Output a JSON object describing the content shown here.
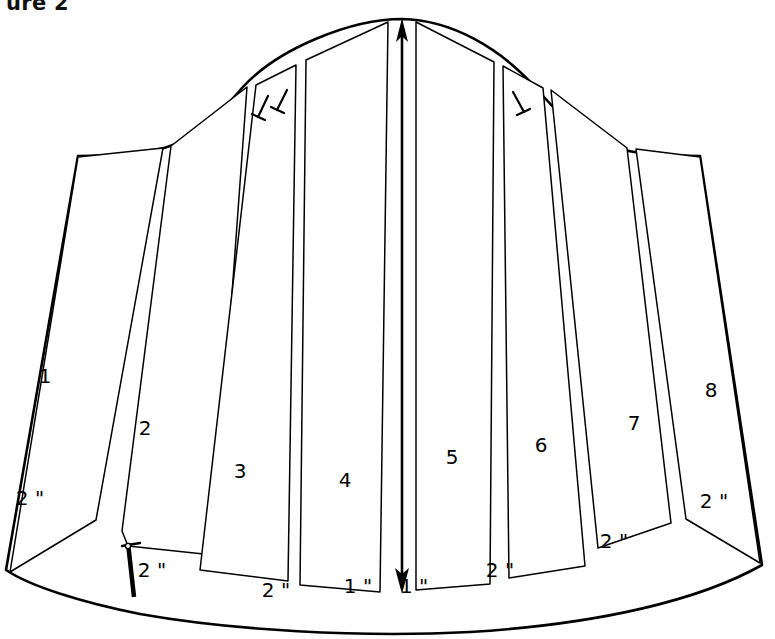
{
  "figure": {
    "caption": "ure 2",
    "title_visible_fragment": "ure 2"
  },
  "diagram": {
    "type": "sewing-pattern-slash-and-spread",
    "line_color": "#000000",
    "fill_color": "#ffffff",
    "background": "#ffffff"
  },
  "sections": [
    {
      "id": 1,
      "label": "1",
      "x": 45,
      "y": 383
    },
    {
      "id": 2,
      "label": "2",
      "x": 145,
      "y": 435
    },
    {
      "id": 3,
      "label": "3",
      "x": 240,
      "y": 478
    },
    {
      "id": 4,
      "label": "4",
      "x": 345,
      "y": 487
    },
    {
      "id": 5,
      "label": "5",
      "x": 452,
      "y": 464
    },
    {
      "id": 6,
      "label": "6",
      "x": 541,
      "y": 452
    },
    {
      "id": 7,
      "label": "7",
      "x": 634,
      "y": 430
    },
    {
      "id": 8,
      "label": "8",
      "x": 711,
      "y": 397
    }
  ],
  "measurements": [
    {
      "id": "gap-left-1",
      "label": "2 \"",
      "x": 30,
      "y": 505
    },
    {
      "id": "gap-left-2",
      "label": "2 \"",
      "x": 143,
      "y": 577
    },
    {
      "id": "gap-left-3",
      "label": "2 \"",
      "x": 272,
      "y": 597
    },
    {
      "id": "gap-center-l",
      "label": "1 \"",
      "x": 352,
      "y": 593
    },
    {
      "id": "gap-center-r",
      "label": "1 \"",
      "x": 395,
      "y": 593
    },
    {
      "id": "gap-right-3",
      "label": "2 \"",
      "x": 498,
      "y": 577
    },
    {
      "id": "gap-right-2",
      "label": "2 \"",
      "x": 612,
      "y": 548
    },
    {
      "id": "gap-right-1",
      "label": "2 \"",
      "x": 712,
      "y": 508
    }
  ],
  "notches": [
    {
      "id": "notch-left-outer",
      "x": 262,
      "y": 104
    },
    {
      "id": "notch-left-inner",
      "x": 281,
      "y": 97
    },
    {
      "id": "notch-right",
      "x": 518,
      "y": 100
    },
    {
      "id": "notch-hem-left",
      "x": 133,
      "y": 548
    }
  ],
  "grainline": {
    "id": "center-grainline-arrow",
    "top_x": 402,
    "top_y": 20,
    "bottom_x": 402,
    "bottom_y": 594,
    "double_headed": true
  }
}
